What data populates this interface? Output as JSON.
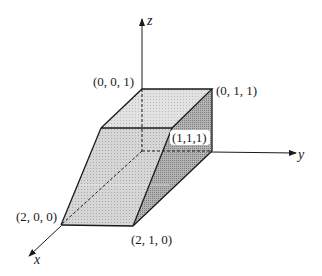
{
  "diagram": {
    "type": "3d-solid-parallelepiped",
    "axes": {
      "x": "x",
      "y": "y",
      "z": "z"
    },
    "vertices": {
      "v001": "(0, 0, 1)",
      "v011": "(0, 1, 1)",
      "v111": "(1,1,1)",
      "v200": "(2, 0, 0)",
      "v210": "(2, 1, 0)"
    },
    "colors": {
      "line": "#1a1a1a",
      "top_face": "#e4e4e4",
      "front_face": "#d4d4d4",
      "side_face": "#a8a8a8",
      "back_face": "#c8c8c8"
    }
  }
}
